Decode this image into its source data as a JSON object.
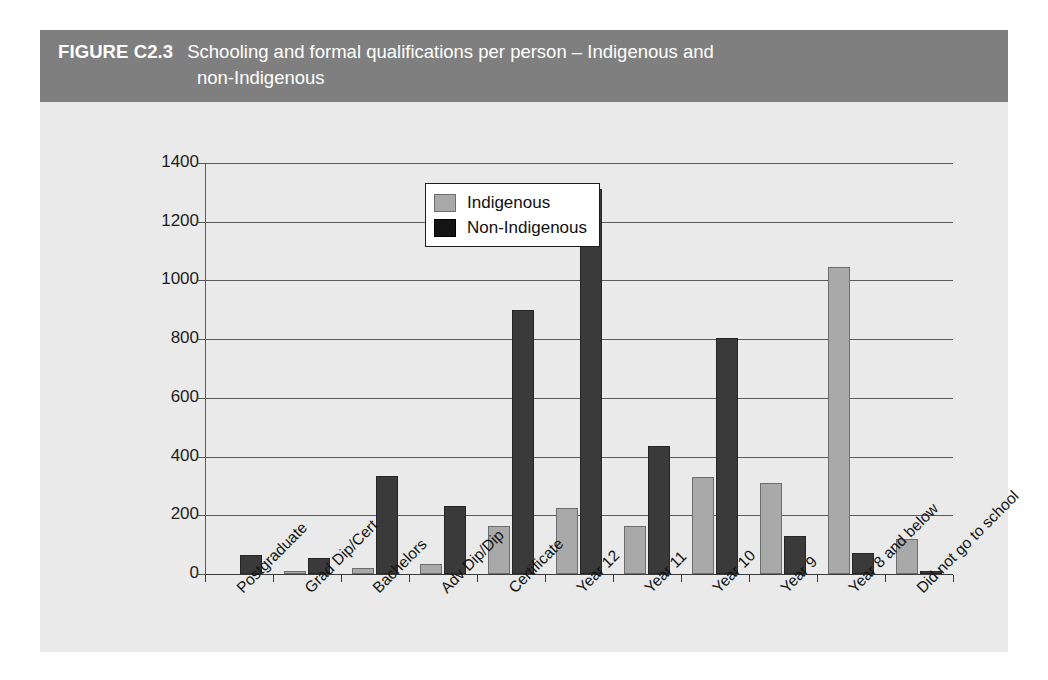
{
  "figure": {
    "number": "FIGURE C2.3",
    "title_line_1": "Schooling and formal qualifications per person – Indigenous and",
    "title_line_2": "non-Indigenous",
    "band_color": "#7f7f7f",
    "panel_color": "#eaeaea"
  },
  "chart_data": {
    "type": "bar",
    "title": "Schooling and formal qualifications per person – Indigenous and non-Indigenous",
    "xlabel": "",
    "ylabel": "",
    "ylim": [
      0,
      1400
    ],
    "ytick_step": 200,
    "yticks": [
      "0",
      "200",
      "400",
      "600",
      "800",
      "1000",
      "1200",
      "1400"
    ],
    "grid": true,
    "legend_position": "top-left-inside",
    "categories": [
      "Postgraduate",
      "Grad Dip/Cert",
      "Bachelors",
      "Adv Dip/Dip",
      "Certificate",
      "Year 12",
      "Year 11",
      "Year 10",
      "Year 9",
      "Year 8 and below",
      "Did not go to school"
    ],
    "series": [
      {
        "name": "Indigenous",
        "color": "#a9a9a9",
        "values": [
          0,
          10,
          20,
          35,
          165,
          225,
          165,
          330,
          310,
          1045,
          120
        ]
      },
      {
        "name": "Non-Indigenous",
        "color": "#3a3a3a",
        "values": [
          65,
          55,
          335,
          232,
          900,
          1310,
          435,
          805,
          130,
          70,
          10
        ]
      }
    ]
  }
}
